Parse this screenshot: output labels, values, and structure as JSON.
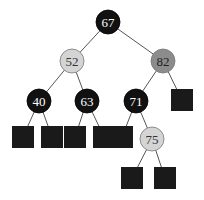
{
  "diagram": {
    "type": "binary-search-tree",
    "colors": {
      "black": "#111111",
      "light": "#d4d4d4",
      "medium": "#8c8c8c",
      "leaf": "#1a1a1a",
      "black_text": "#ffffff",
      "light_text": "#333333",
      "medium_text": "#222222"
    },
    "nodes": [
      {
        "id": "n67",
        "key": "67",
        "kind": "internal",
        "color": "black"
      },
      {
        "id": "n52",
        "key": "52",
        "kind": "internal",
        "color": "light"
      },
      {
        "id": "n82",
        "key": "82",
        "kind": "internal",
        "color": "medium"
      },
      {
        "id": "n40",
        "key": "40",
        "kind": "internal",
        "color": "black"
      },
      {
        "id": "n63",
        "key": "63",
        "kind": "internal",
        "color": "black"
      },
      {
        "id": "n71",
        "key": "71",
        "kind": "internal",
        "color": "black"
      },
      {
        "id": "n75",
        "key": "75",
        "kind": "internal",
        "color": "light"
      },
      {
        "id": "l1",
        "key": "",
        "kind": "leaf",
        "color": "leaf"
      },
      {
        "id": "l2",
        "key": "",
        "kind": "leaf",
        "color": "leaf"
      },
      {
        "id": "l3",
        "key": "",
        "kind": "leaf",
        "color": "leaf"
      },
      {
        "id": "l4",
        "key": "",
        "kind": "leaf",
        "color": "leaf"
      },
      {
        "id": "l5",
        "key": "",
        "kind": "leaf",
        "color": "leaf"
      },
      {
        "id": "l6",
        "key": "",
        "kind": "leaf",
        "color": "leaf"
      },
      {
        "id": "l7",
        "key": "",
        "kind": "leaf",
        "color": "leaf"
      },
      {
        "id": "l8",
        "key": "",
        "kind": "leaf",
        "color": "leaf"
      }
    ],
    "edges": [
      [
        "n67",
        "n52"
      ],
      [
        "n67",
        "n82"
      ],
      [
        "n52",
        "n40"
      ],
      [
        "n52",
        "n63"
      ],
      [
        "n82",
        "n71"
      ],
      [
        "n82",
        "l8"
      ],
      [
        "n40",
        "l1"
      ],
      [
        "n40",
        "l2"
      ],
      [
        "n63",
        "l3"
      ],
      [
        "n63",
        "l4"
      ],
      [
        "n71",
        "l5"
      ],
      [
        "n71",
        "n75"
      ],
      [
        "n75",
        "l6"
      ],
      [
        "n75",
        "l7"
      ]
    ]
  }
}
